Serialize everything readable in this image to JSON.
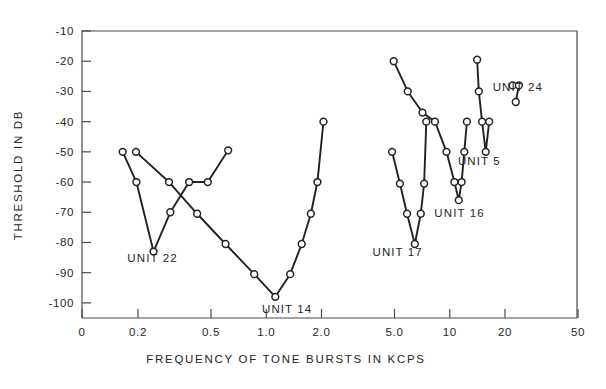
{
  "chart_data": {
    "type": "line",
    "title": "",
    "xlabel": "FREQUENCY OF TONE BURSTS IN KCPS",
    "ylabel": "THRESHOLD IN DB",
    "xscale": "log",
    "yscale": "linear",
    "xlim": [
      0.13,
      50
    ],
    "ylim": [
      -105,
      -10
    ],
    "grid": false,
    "legend": "inline-annotations",
    "xticks": [
      {
        "value": 0.13,
        "label": "0"
      },
      {
        "value": 0.2,
        "label": "0.2"
      },
      {
        "value": 0.5,
        "label": "0.5"
      },
      {
        "value": 1.0,
        "label": "1.0"
      },
      {
        "value": 2.0,
        "label": "2.0"
      },
      {
        "value": 5.0,
        "label": "5.0"
      },
      {
        "value": 10,
        "label": "10"
      },
      {
        "value": 20,
        "label": "20"
      },
      {
        "value": 50,
        "label": "50"
      }
    ],
    "yticks": [
      {
        "value": -10,
        "label": "-10"
      },
      {
        "value": -20,
        "label": "-20"
      },
      {
        "value": -30,
        "label": "-30"
      },
      {
        "value": -40,
        "label": "-40"
      },
      {
        "value": -50,
        "label": "-50"
      },
      {
        "value": -60,
        "label": "-60"
      },
      {
        "value": -70,
        "label": "-70"
      },
      {
        "value": -80,
        "label": "-80"
      },
      {
        "value": -90,
        "label": "-90"
      },
      {
        "value": -100,
        "label": "-100"
      }
    ],
    "series": [
      {
        "name": "UNIT 22",
        "label": "UNIT 22",
        "label_x": 0.24,
        "label_y": -86.5,
        "x": [
          0.165,
          0.196,
          0.243,
          0.3,
          0.38,
          0.48,
          0.62
        ],
        "y": [
          -50,
          -60,
          -83,
          -70,
          -60,
          -60,
          -49.5
        ]
      },
      {
        "name": "UNIT 14",
        "label": "UNIT 14",
        "label_x": 1.3,
        "label_y": -103.5,
        "x": [
          0.195,
          0.295,
          0.42,
          0.6,
          0.86,
          1.12,
          1.35,
          1.56,
          1.75,
          1.9,
          2.05
        ],
        "y": [
          -50,
          -60,
          -70.5,
          -80.5,
          -90.5,
          -98,
          -90.5,
          -80.5,
          -70.5,
          -60,
          -40
        ]
      },
      {
        "name": "UNIT 17",
        "label": "UNIT 17",
        "label_x": 5.2,
        "label_y": -84.5,
        "x": [
          4.85,
          5.35,
          5.85,
          6.45,
          6.95,
          7.25,
          7.45
        ],
        "y": [
          -50,
          -60.5,
          -70.5,
          -80.5,
          -70.5,
          -60.5,
          -40
        ]
      },
      {
        "name": "UNIT 16",
        "label": "UNIT 16",
        "label_x": 11.3,
        "label_y": -71.5,
        "x": [
          4.95,
          5.9,
          7.1,
          8.3,
          9.6,
          10.6,
          11.2,
          11.6,
          12.0,
          12.4
        ],
        "y": [
          -20,
          -30,
          -37,
          -40,
          -50,
          -60,
          -66,
          -60,
          -50,
          -40
        ]
      },
      {
        "name": "UNIT 5",
        "label": "UNIT 5",
        "label_x": 14.5,
        "label_y": -54.5,
        "x": [
          14.1,
          14.4,
          15.0,
          15.7,
          16.4
        ],
        "y": [
          -19.5,
          -30,
          -40,
          -50,
          -40
        ]
      },
      {
        "name": "UNIT 24",
        "label": "UNIT 24",
        "label_x": 23.5,
        "label_y": -30,
        "x": [
          22.0,
          23.8,
          22.9
        ],
        "y": [
          -28,
          -28,
          -33.5
        ]
      }
    ]
  }
}
